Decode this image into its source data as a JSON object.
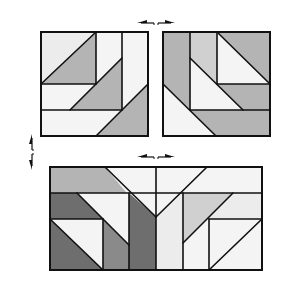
{
  "diagram": {
    "colors": {
      "outline": "#111111",
      "light": "#ececec",
      "lighter": "#f4f4f4",
      "mid": "#b4b4b4",
      "midlight": "#d0d0d0",
      "dark": "#8a8a8a",
      "darker": "#6e6e6e",
      "background": "#ffffff"
    },
    "blocks": [
      {
        "id": "top-left-block",
        "rect": [
          41,
          32,
          148,
          136
        ],
        "pieces": [
          {
            "points": "41,32 96,32 41,84",
            "fill": "light"
          },
          {
            "points": "96,32 96,84 41,84",
            "fill": "mid"
          },
          {
            "points": "96,32 122,32 122,58 96,84",
            "fill": "lighter"
          },
          {
            "points": "122,32 148,32 148,84 122,110",
            "fill": "lighter"
          },
          {
            "points": "41,84 96,84 70,110 41,110",
            "fill": "lighter"
          },
          {
            "points": "96,84 122,58 122,110 70,110",
            "fill": "mid"
          },
          {
            "points": "41,110 122,110 96,136 41,136",
            "fill": "lighter"
          },
          {
            "points": "122,110 148,84 148,136 96,136",
            "fill": "mid"
          }
        ],
        "lines": [
          [
            96,
            32,
            96,
            84
          ],
          [
            122,
            32,
            122,
            110
          ],
          [
            41,
            84,
            96,
            84
          ],
          [
            41,
            110,
            122,
            110
          ],
          [
            41,
            84,
            96,
            32
          ],
          [
            70,
            110,
            122,
            58
          ],
          [
            96,
            136,
            148,
            84
          ]
        ]
      },
      {
        "id": "top-right-block",
        "rect": [
          163,
          32,
          270,
          136
        ],
        "pieces": [
          {
            "points": "163,32 190,32 190,110 163,84",
            "fill": "mid"
          },
          {
            "points": "190,32 217,32 217,84 190,58",
            "fill": "midlight"
          },
          {
            "points": "217,32 270,84 217,84",
            "fill": "lighter"
          },
          {
            "points": "217,32 270,32 270,84",
            "fill": "mid"
          },
          {
            "points": "190,58 217,84 243,110 190,110",
            "fill": "lighter"
          },
          {
            "points": "217,84 270,84 270,110 243,110",
            "fill": "mid"
          },
          {
            "points": "163,84 190,110 216,136 163,136",
            "fill": "lighter"
          },
          {
            "points": "190,110 270,110 270,136 216,136",
            "fill": "mid"
          }
        ],
        "lines": [
          [
            190,
            32,
            190,
            110
          ],
          [
            217,
            32,
            217,
            84
          ],
          [
            217,
            84,
            270,
            84
          ],
          [
            190,
            110,
            270,
            110
          ],
          [
            217,
            32,
            270,
            84
          ],
          [
            190,
            58,
            243,
            110
          ],
          [
            163,
            84,
            216,
            136
          ]
        ]
      },
      {
        "id": "bottom-block",
        "rect": [
          50,
          167,
          262,
          270
        ],
        "pieces": [
          {
            "points": "50,167 105,167 127,193 50,193",
            "fill": "mid"
          },
          {
            "points": "105,167 156,167 156,217 127,193",
            "fill": "lighter"
          },
          {
            "points": "156,167 207,167 156,217",
            "fill": "lighter"
          },
          {
            "points": "207,167 262,167 262,193 183,193",
            "fill": "lighter"
          },
          {
            "points": "50,193 77,193 103,219 50,219",
            "fill": "darker"
          },
          {
            "points": "77,193 129,193 129,245 103,219",
            "fill": "lighter"
          },
          {
            "points": "129,193 156,217 156,270 129,270",
            "fill": "darker"
          },
          {
            "points": "156,217 183,193 183,270 156,270",
            "fill": "light"
          },
          {
            "points": "183,193 233,193 183,243",
            "fill": "midlight"
          },
          {
            "points": "233,193 262,193 262,219 209,219",
            "fill": "light"
          },
          {
            "points": "103,219 129,245 129,270 103,270",
            "fill": "dark"
          },
          {
            "points": "50,219 103,219 103,270",
            "fill": "lighter"
          },
          {
            "points": "50,219 103,270 50,270",
            "fill": "darker"
          },
          {
            "points": "183,243 209,219 209,270 183,270",
            "fill": "lighter"
          },
          {
            "points": "209,219 262,219 209,270",
            "fill": "lighter"
          },
          {
            "points": "262,219 262,270 209,270",
            "fill": "lighter"
          }
        ],
        "lines": [
          [
            50,
            193,
            262,
            193
          ],
          [
            50,
            219,
            103,
            219
          ],
          [
            209,
            219,
            262,
            219
          ],
          [
            156,
            167,
            156,
            270
          ],
          [
            129,
            193,
            129,
            270
          ],
          [
            183,
            193,
            183,
            270
          ],
          [
            103,
            219,
            103,
            270
          ],
          [
            209,
            219,
            209,
            270
          ],
          [
            105,
            167,
            156,
            217
          ],
          [
            207,
            167,
            156,
            217
          ],
          [
            77,
            193,
            129,
            245
          ],
          [
            233,
            193,
            183,
            243
          ],
          [
            50,
            219,
            103,
            270
          ],
          [
            262,
            219,
            209,
            270
          ]
        ]
      }
    ],
    "arrows": [
      {
        "id": "top-horizontal-arrow",
        "orientation": "horizontal",
        "x1": 137,
        "x2": 175,
        "y": 23
      },
      {
        "id": "middle-horizontal-arrow",
        "orientation": "horizontal",
        "x1": 137,
        "x2": 175,
        "y": 157
      },
      {
        "id": "left-vertical-arrow",
        "orientation": "vertical",
        "x": 32,
        "y1": 134,
        "y2": 170
      }
    ]
  }
}
